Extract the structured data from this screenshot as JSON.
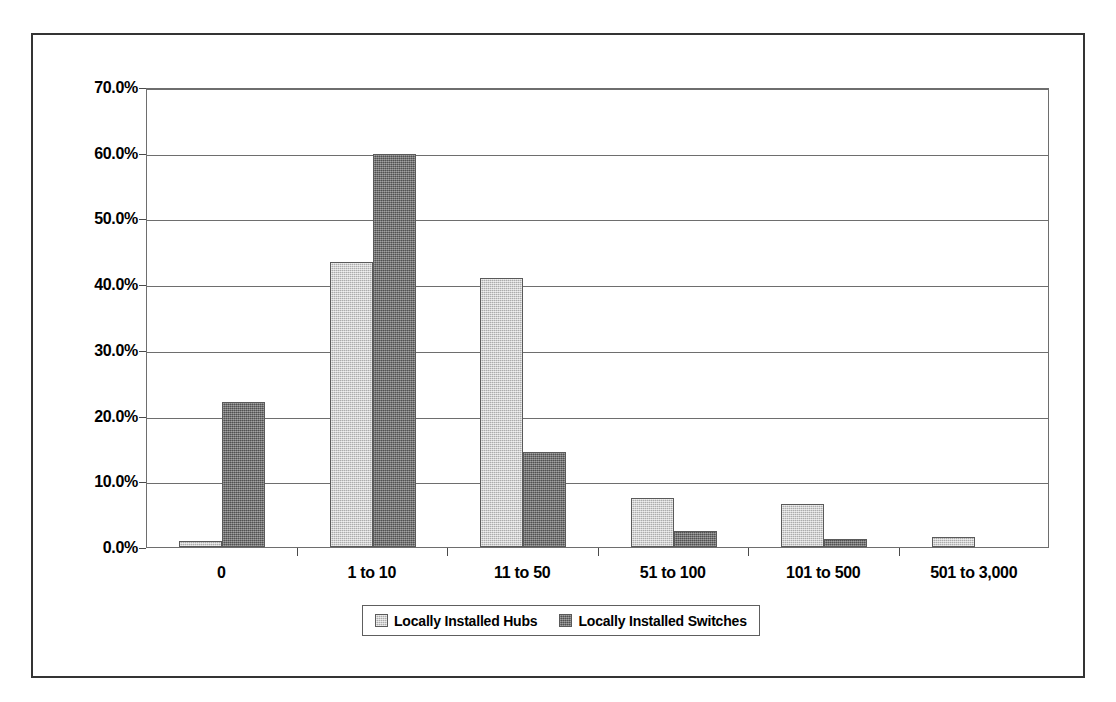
{
  "chart_data": {
    "type": "bar",
    "title": "",
    "subtitle": "",
    "xlabel": "",
    "ylabel": "",
    "categories": [
      "0",
      "1 to 10",
      "11 to 50",
      "51 to 100",
      "101 to 500",
      "501 to 3,000"
    ],
    "series": [
      {
        "name": "Locally Installed Hubs",
        "color": "#c2c2c2",
        "values": [
          0.9,
          43.3,
          41.0,
          7.5,
          6.6,
          1.5
        ]
      },
      {
        "name": "Locally Installed Switches",
        "color": "#6f6f6f",
        "values": [
          22.1,
          59.8,
          14.5,
          2.4,
          1.2,
          0.0
        ]
      }
    ],
    "ylim": [
      0,
      70
    ],
    "ytick_values": [
      0,
      10,
      20,
      30,
      40,
      50,
      60,
      70
    ],
    "ytick_labels": [
      "0.0%",
      "10.0%",
      "20.0%",
      "30.0%",
      "40.0%",
      "50.0%",
      "60.0%",
      "70.0%"
    ],
    "grid": true,
    "legend_position": "bottom",
    "legend_entries": [
      "Locally Installed Hubs",
      "Locally Installed Switches"
    ]
  }
}
